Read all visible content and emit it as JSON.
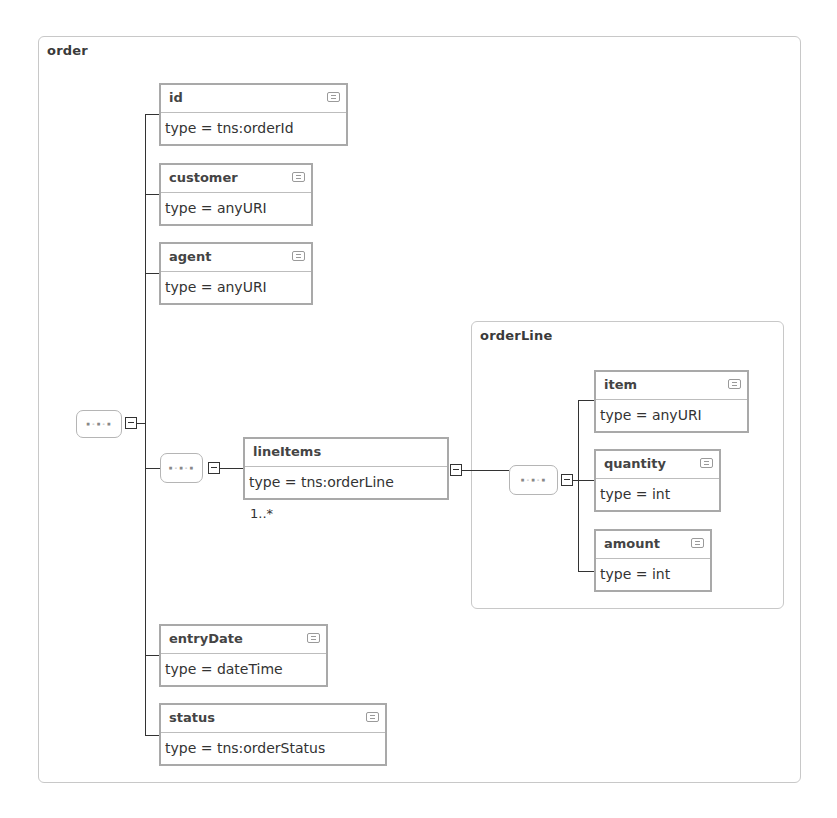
{
  "diagram": {
    "root": {
      "name": "order",
      "children": [
        {
          "name": "id",
          "type": "type = tns:orderId"
        },
        {
          "name": "customer",
          "type": "type = anyURI"
        },
        {
          "name": "agent",
          "type": "type = anyURI"
        },
        {
          "name": "lineItems",
          "type": "type = tns:orderLine",
          "multiplicity": "1..*"
        },
        {
          "name": "entryDate",
          "type": "type = dateTime"
        },
        {
          "name": "status",
          "type": "type = tns:orderStatus"
        }
      ]
    },
    "orderLine": {
      "name": "orderLine",
      "children": [
        {
          "name": "item",
          "type": "type = anyURI"
        },
        {
          "name": "quantity",
          "type": "type = int"
        },
        {
          "name": "amount",
          "type": "type = int"
        }
      ]
    },
    "sequence_glyph": "▪-▪-▪",
    "icons": {
      "documentation": "documentation-icon",
      "collapse": "minus-icon",
      "sequence": "sequence-compositor-icon"
    }
  }
}
